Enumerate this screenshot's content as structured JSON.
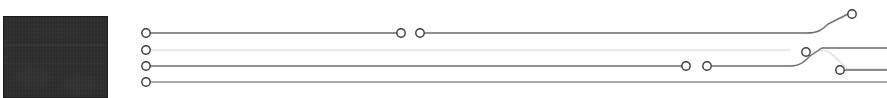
{
  "canvas": {
    "width": 887,
    "height": 98,
    "background": "#ffffff"
  },
  "preview_panel": {
    "label": "video-preview-thumbnail",
    "fill": "#2e2e2e",
    "border": "#1b1b1b",
    "x": 3,
    "y": 16,
    "width": 105,
    "height": 82
  },
  "wire_graph": {
    "label": "signal-routing-wire-graph",
    "node_radius": 4.2,
    "node_stroke": "#3a3a3f",
    "node_fill": "#ffffff",
    "node_stroke_width": 1.4,
    "tracks": [
      {
        "id": "track-1",
        "y": 33,
        "color": "#6a6a70",
        "width": 1.4,
        "segments": [
          {
            "id": "seg-1a",
            "d": "M 148 33 L 398 33"
          },
          {
            "id": "seg-1b",
            "d": "M 421 33 L 806 33 C 818 33 822 30 828 24 L 848 14"
          }
        ],
        "nodes": [
          {
            "id": "node-1-start",
            "cx": 146,
            "cy": 33
          },
          {
            "id": "node-1-mid-out",
            "cx": 401,
            "cy": 33
          },
          {
            "id": "node-1-mid-in",
            "cx": 420,
            "cy": 33
          },
          {
            "id": "node-1-end",
            "cx": 852,
            "cy": 14
          }
        ]
      },
      {
        "id": "track-2",
        "y": 50,
        "color": "#e2e2e4",
        "width": 1.6,
        "segments": [
          {
            "id": "seg-2a",
            "d": "M 148 50 L 790 50"
          },
          {
            "id": "seg-2b",
            "d": "M 820 50 C 828 50 832 54 838 60 L 848 69 L 887 69"
          }
        ],
        "nodes": [
          {
            "id": "node-2-start",
            "cx": 146,
            "cy": 50
          },
          {
            "id": "node-2-mid",
            "cx": 806,
            "cy": 52
          }
        ]
      },
      {
        "id": "track-3",
        "y": 66,
        "color": "#6a6a70",
        "width": 1.4,
        "segments": [
          {
            "id": "seg-3a",
            "d": "M 148 66 L 682 66"
          },
          {
            "id": "seg-3b",
            "d": "M 712 66 L 790 66 C 800 66 804 62 810 56 L 822 48 L 887 48"
          },
          {
            "id": "seg-3c",
            "d": "M 845 70 L 887 70"
          }
        ],
        "nodes": [
          {
            "id": "node-3-start",
            "cx": 146,
            "cy": 66
          },
          {
            "id": "node-3-mid-out",
            "cx": 686,
            "cy": 66
          },
          {
            "id": "node-3-mid-in",
            "cx": 707,
            "cy": 66
          },
          {
            "id": "node-3-tap",
            "cx": 840,
            "cy": 70
          }
        ]
      },
      {
        "id": "track-4",
        "y": 82,
        "color": "#8d8d93",
        "width": 1.3,
        "segments": [
          {
            "id": "seg-4a",
            "d": "M 148 82 L 887 82"
          }
        ],
        "nodes": [
          {
            "id": "node-4-start",
            "cx": 146,
            "cy": 82
          }
        ]
      }
    ]
  }
}
